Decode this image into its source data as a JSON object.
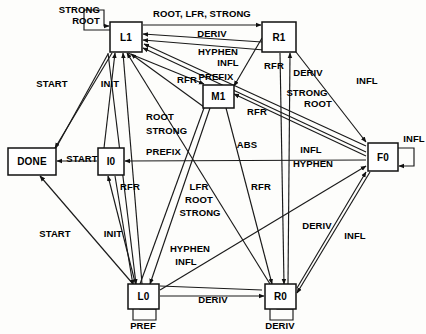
{
  "diagram": {
    "type": "state-transition-diagram",
    "width": 426,
    "height": 334,
    "background_color": "#fdfdfb",
    "line_color": "#1a1a1a",
    "node_fill": "#ffffff",
    "nodes": [
      {
        "id": "L1",
        "label": "L1",
        "x": 110,
        "y": 22,
        "w": 32,
        "h": 30
      },
      {
        "id": "R1",
        "label": "R1",
        "x": 262,
        "y": 22,
        "w": 34,
        "h": 30
      },
      {
        "id": "M1",
        "label": "M1",
        "x": 203,
        "y": 85,
        "w": 31,
        "h": 23
      },
      {
        "id": "DONE",
        "label": "DONE",
        "x": 8,
        "y": 148,
        "w": 48,
        "h": 27
      },
      {
        "id": "I0",
        "label": "I0",
        "x": 98,
        "y": 148,
        "w": 26,
        "h": 27
      },
      {
        "id": "F0",
        "label": "F0",
        "x": 368,
        "y": 143,
        "w": 30,
        "h": 28
      },
      {
        "id": "L0",
        "label": "L0",
        "x": 128,
        "y": 284,
        "w": 31,
        "h": 25
      },
      {
        "id": "R0",
        "label": "R0",
        "x": 265,
        "y": 284,
        "w": 31,
        "h": 25
      }
    ],
    "self_loops": [
      {
        "node": "L1",
        "label": "STROCK",
        "label_lines": [
          "STRONG",
          "ROOT"
        ],
        "position": "upper-left"
      },
      {
        "node": "F0",
        "label": "INFL",
        "label_lines": [
          "INFL"
        ],
        "position": "right"
      },
      {
        "node": "L0",
        "label": "PREF",
        "label_lines": [
          "PREF"
        ],
        "position": "below"
      },
      {
        "node": "R0",
        "label": "DERIV",
        "label_lines": [
          "DERIV"
        ],
        "position": "below"
      }
    ],
    "edge_labels": [
      {
        "text": "STRONG",
        "x": 100,
        "y": 13,
        "anchor": "end"
      },
      {
        "text": "ROOT",
        "x": 100,
        "y": 24,
        "anchor": "end"
      },
      {
        "text": "ROOT, LFR, STRONG",
        "x": 202,
        "y": 17,
        "anchor": "middle"
      },
      {
        "text": "DERIV",
        "x": 212,
        "y": 37,
        "anchor": "middle"
      },
      {
        "text": "HYPHEN",
        "x": 218,
        "y": 55,
        "anchor": "middle"
      },
      {
        "text": "INFL",
        "x": 228,
        "y": 66,
        "anchor": "middle"
      },
      {
        "text": "PREFIX",
        "x": 216,
        "y": 80,
        "anchor": "middle"
      },
      {
        "text": "RFR",
        "x": 187,
        "y": 83,
        "anchor": "middle"
      },
      {
        "text": "RFR",
        "x": 274,
        "y": 69,
        "anchor": "middle"
      },
      {
        "text": "DERIV",
        "x": 308,
        "y": 76,
        "anchor": "middle"
      },
      {
        "text": "INFL",
        "x": 367,
        "y": 84,
        "anchor": "middle"
      },
      {
        "text": "STRONG",
        "x": 307,
        "y": 96,
        "anchor": "middle"
      },
      {
        "text": "ROOT",
        "x": 318,
        "y": 107,
        "anchor": "middle"
      },
      {
        "text": "RFR",
        "x": 257,
        "y": 115,
        "anchor": "middle"
      },
      {
        "text": "START",
        "x": 52,
        "y": 87,
        "anchor": "middle"
      },
      {
        "text": "INIT",
        "x": 110,
        "y": 87,
        "anchor": "middle"
      },
      {
        "text": "ROOT",
        "x": 146,
        "y": 120,
        "anchor": "start"
      },
      {
        "text": "STRONG",
        "x": 146,
        "y": 134,
        "anchor": "start"
      },
      {
        "text": "PREFIX",
        "x": 146,
        "y": 155,
        "anchor": "start"
      },
      {
        "text": "ABS",
        "x": 247,
        "y": 148,
        "anchor": "middle"
      },
      {
        "text": "INFL",
        "x": 311,
        "y": 153,
        "anchor": "middle"
      },
      {
        "text": "HYPHEN",
        "x": 313,
        "y": 167,
        "anchor": "middle"
      },
      {
        "text": "START",
        "x": 82,
        "y": 162,
        "anchor": "middle"
      },
      {
        "text": "INFL",
        "x": 414,
        "y": 142,
        "anchor": "middle"
      },
      {
        "text": "RFR",
        "x": 130,
        "y": 190,
        "anchor": "middle"
      },
      {
        "text": "LFR",
        "x": 199,
        "y": 190,
        "anchor": "middle"
      },
      {
        "text": "ROOT",
        "x": 199,
        "y": 203,
        "anchor": "middle"
      },
      {
        "text": "STRONG",
        "x": 200,
        "y": 216,
        "anchor": "middle"
      },
      {
        "text": "RFR",
        "x": 261,
        "y": 190,
        "anchor": "middle"
      },
      {
        "text": "START",
        "x": 55,
        "y": 237,
        "anchor": "middle"
      },
      {
        "text": "INIT",
        "x": 113,
        "y": 237,
        "anchor": "middle"
      },
      {
        "text": "HYPHEN",
        "x": 190,
        "y": 252,
        "anchor": "middle"
      },
      {
        "text": "INFL",
        "x": 186,
        "y": 265,
        "anchor": "middle"
      },
      {
        "text": "DERIV",
        "x": 317,
        "y": 229,
        "anchor": "middle"
      },
      {
        "text": "INFL",
        "x": 355,
        "y": 239,
        "anchor": "middle"
      },
      {
        "text": "DERIV",
        "x": 213,
        "y": 303,
        "anchor": "middle"
      },
      {
        "text": "PREF",
        "x": 143,
        "y": 329,
        "anchor": "middle"
      },
      {
        "text": "DERIV",
        "x": 280,
        "y": 329,
        "anchor": "middle"
      }
    ]
  }
}
